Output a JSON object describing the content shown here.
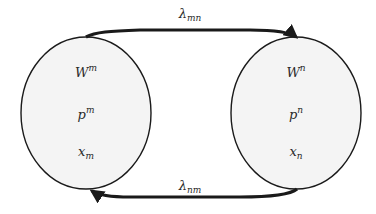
{
  "diagram": {
    "colors": {
      "stroke": "#1a1a1a",
      "fill": "#f4f4f4",
      "text": "#2a2a2a",
      "background": "#ffffff"
    },
    "nodes": [
      {
        "id": "m",
        "variables": [
          {
            "base": "W",
            "sup": "m",
            "sub": ""
          },
          {
            "base": "p",
            "sup": "m",
            "sub": ""
          },
          {
            "base": "x",
            "sup": "",
            "sub": "m"
          }
        ]
      },
      {
        "id": "n",
        "variables": [
          {
            "base": "W",
            "sup": "n",
            "sub": ""
          },
          {
            "base": "p",
            "sup": "n",
            "sub": ""
          },
          {
            "base": "x",
            "sup": "",
            "sub": "n"
          }
        ]
      }
    ],
    "edges": [
      {
        "from": "m",
        "to": "n",
        "label_base": "λ",
        "label_sub": "mn"
      },
      {
        "from": "n",
        "to": "m",
        "label_base": "λ",
        "label_sub": "nm"
      }
    ]
  }
}
